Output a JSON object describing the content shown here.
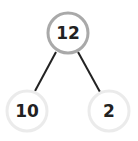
{
  "diagram": {
    "type": "number-bond",
    "whole": {
      "value": "12",
      "border_color": "#a9a9a9"
    },
    "parts": [
      {
        "value": "10",
        "border_color": "#ebebeb"
      },
      {
        "value": "2",
        "border_color": "#ebebeb"
      }
    ],
    "connector_color": "#222222"
  }
}
